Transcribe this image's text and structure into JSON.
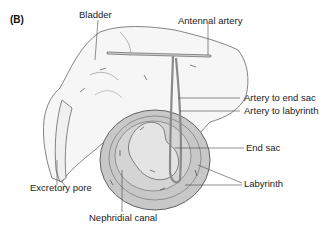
{
  "figure": {
    "panel_label": "(B)",
    "labels": {
      "bladder": "Bladder",
      "antennal_artery": "Antennal artery",
      "artery_to_end_sac": "Artery to end sac",
      "artery_to_labyrinth": "Artery to labyrinth",
      "end_sac": "End sac",
      "labyrinth": "Labyrinth",
      "excretory_pore": "Excretory pore",
      "nephridial_canal": "Nephridial canal"
    },
    "colors": {
      "outline": "#555555",
      "bladder_fill": "#f6f6f6",
      "gland_outer": "#c8c8c8",
      "gland_inner": "#dcdcdc",
      "artery": "#9a9a9a",
      "leader": "#444444"
    }
  }
}
